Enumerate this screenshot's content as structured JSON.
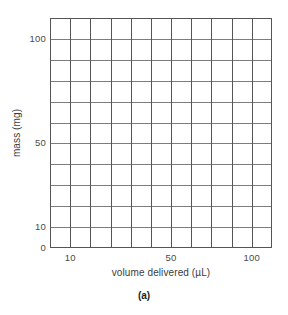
{
  "figure": {
    "caption": "(a)"
  },
  "chart_data": {
    "type": "line",
    "title": "",
    "subtitle": "",
    "xlabel": "volume delivered (µL)",
    "ylabel": "mass (mg)",
    "series": [],
    "annotations": [],
    "legend": {
      "entries": [],
      "position": "none"
    },
    "grid": {
      "visible": true,
      "columns": 11,
      "rows": 11,
      "vertical_line_color": "#555555",
      "horizontal_line_color": "#7d7d7d",
      "border_color": "#555555"
    },
    "x_axis": {
      "scale": "log",
      "tick_labels": [
        "10",
        "50",
        "100"
      ],
      "tick_values": [
        10,
        50,
        100
      ],
      "tick_positions_pct": [
        9.09,
        54.55,
        90.91
      ],
      "range_label": "blank log grid"
    },
    "y_axis": {
      "scale": "log",
      "tick_labels": [
        "0",
        "10",
        "50",
        "100"
      ],
      "tick_values": [
        0,
        10,
        50,
        100
      ],
      "tick_positions_pct": [
        100,
        90.91,
        54.55,
        9.09
      ],
      "range_label": "blank log grid"
    },
    "note": "Empty log-log graph paper grid with no plotted data points"
  },
  "axes": {
    "y_ticks": [
      {
        "label": "100",
        "top_pct": 9.09
      },
      {
        "label": "50",
        "top_pct": 54.55
      },
      {
        "label": "10",
        "top_pct": 90.91
      },
      {
        "label": "0",
        "top_pct": 100
      }
    ],
    "x_ticks": [
      {
        "label": "10",
        "left_pct": 9.09
      },
      {
        "label": "50",
        "left_pct": 54.55
      },
      {
        "label": "100",
        "left_pct": 90.91
      }
    ]
  },
  "colors": {
    "grid_vertical": "#555555",
    "grid_horizontal": "#7d7d7d",
    "border": "#555555",
    "text": "#3d3d3d",
    "tick_text": "#4a4a4a",
    "background": "#ffffff"
  }
}
